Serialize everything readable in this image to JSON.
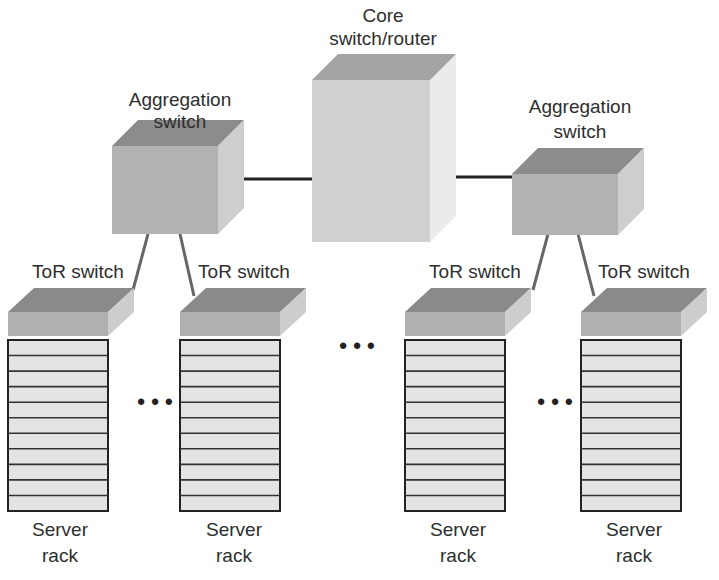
{
  "diagram": {
    "core": {
      "label_line1": "Core",
      "label_line2": "switch/router"
    },
    "aggregation": [
      {
        "label_line1": "Aggregation",
        "label_line2": "switch"
      },
      {
        "label_line1": "Aggregation",
        "label_line2": "switch"
      }
    ],
    "tor": [
      {
        "label": "ToR switch"
      },
      {
        "label": "ToR switch"
      },
      {
        "label": "ToR switch"
      },
      {
        "label": "ToR switch"
      }
    ],
    "racks": [
      {
        "label_line1": "Server",
        "label_line2": "rack",
        "shelves": 11
      },
      {
        "label_line1": "Server",
        "label_line2": "rack",
        "shelves": 11
      },
      {
        "label_line1": "Server",
        "label_line2": "rack",
        "shelves": 11
      },
      {
        "label_line1": "Server",
        "label_line2": "rack",
        "shelves": 11
      }
    ],
    "ellipsis": "• • •",
    "colors": {
      "box_front": "#b4b4b4",
      "box_top": "#8a8a8a",
      "box_side": "#cfcfcf",
      "core_front": "#d2d2d2",
      "core_top": "#a8a8a8",
      "core_side": "#ececec",
      "rack_fill": "#e6e6e6",
      "line": "#222222",
      "link": "#666666"
    }
  }
}
